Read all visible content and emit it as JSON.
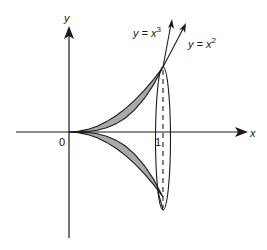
{
  "figure": {
    "axes": {
      "x_label": "x",
      "y_label": "y",
      "origin_label": "0",
      "tick_label_x1": "1"
    },
    "curves": [
      {
        "name": "cubic",
        "label_prefix": "y = x",
        "label_exp": "3"
      },
      {
        "name": "quadratic",
        "label_prefix": "y = x",
        "label_exp": "2"
      }
    ],
    "colors": {
      "line": "#1a1a1a",
      "shade": "#a9a9a9",
      "background": "#ffffff"
    }
  }
}
